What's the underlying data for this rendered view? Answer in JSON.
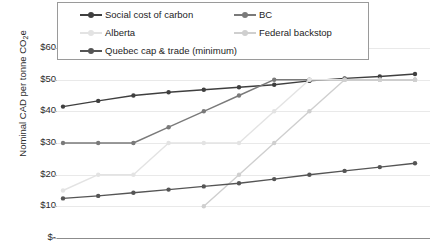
{
  "chart_data": {
    "type": "line",
    "title": "",
    "xlabel": "",
    "ylabel": "Nominal CAD per tonne CO2e",
    "ylabel_text": "Nominal CAD per tonne CO",
    "ylabel_sub": "2",
    "ylabel_tail": "e",
    "ylim": [
      0,
      60
    ],
    "grid": true,
    "legend_position": "top",
    "ytick_labels": [
      "$60",
      "$50",
      "$40",
      "$30",
      "$20",
      "$10",
      "$-"
    ],
    "ytick_values": [
      60,
      50,
      40,
      30,
      20,
      10,
      0
    ],
    "x": [
      1,
      2,
      3,
      4,
      5,
      6,
      7,
      8,
      9,
      10,
      11
    ],
    "series": [
      {
        "name": "Social cost of carbon",
        "color": "#3f3f3f",
        "values": [
          41.5,
          43.3,
          45.0,
          46.0,
          46.8,
          47.6,
          48.4,
          49.6,
          50.4,
          51.0,
          51.8
        ]
      },
      {
        "name": "BC",
        "color": "#7a7a7a",
        "values": [
          30.0,
          30.0,
          30.0,
          35.0,
          40.0,
          45.0,
          50.0,
          50.0,
          50.0,
          50.0,
          50.0
        ]
      },
      {
        "name": "Alberta",
        "color": "#e3e3e3",
        "values": [
          15.0,
          20.0,
          20.0,
          30.0,
          30.0,
          30.0,
          40.0,
          50.0,
          50.0,
          50.0,
          50.0
        ]
      },
      {
        "name": "Federal backstop",
        "color": "#cfcfcf",
        "values": [
          null,
          null,
          null,
          null,
          10.0,
          20.0,
          30.0,
          40.0,
          50.0,
          50.0,
          50.0
        ]
      },
      {
        "name": "Quebec cap & trade (minimum)",
        "color": "#555555",
        "values": [
          12.5,
          13.3,
          14.3,
          15.3,
          16.3,
          17.3,
          18.6,
          20.0,
          21.2,
          22.4,
          23.6
        ]
      }
    ]
  },
  "legend": {
    "items": [
      {
        "label": "Social cost of carbon",
        "color": "#3f3f3f",
        "marker": true
      },
      {
        "label": "BC",
        "color": "#7a7a7a",
        "marker": true
      },
      {
        "label": "Alberta",
        "color": "#e3e3e3",
        "marker": true
      },
      {
        "label": "Federal backstop",
        "color": "#cfcfcf",
        "marker": true
      },
      {
        "label": "Quebec cap & trade (minimum)",
        "color": "#555555",
        "marker": true
      }
    ]
  },
  "axis": {
    "gridline_color": "#e9e9e9",
    "baseline_color": "#8c8c8c"
  }
}
